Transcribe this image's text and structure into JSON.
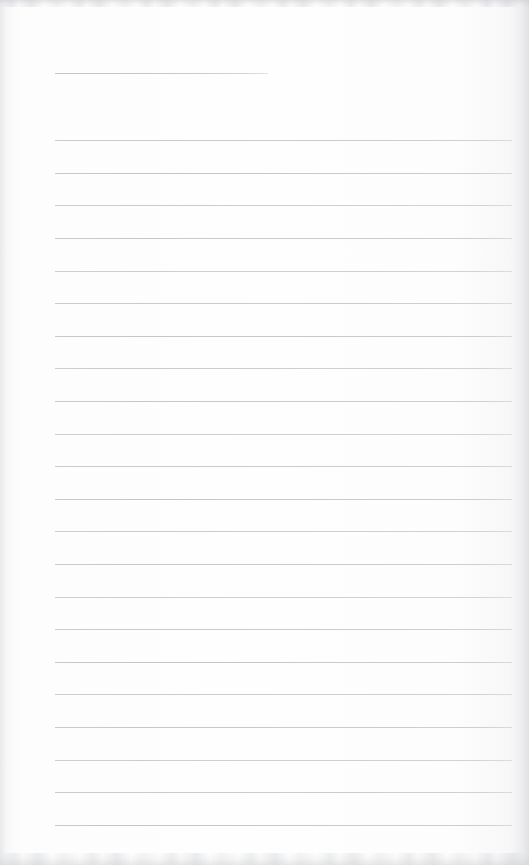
{
  "page": {
    "name": "ruled-notepad-page",
    "width": 529,
    "height": 865,
    "background_color": "#fdfdfd",
    "rule_color": "#c5c7cb",
    "edge_shadow_color": "#c8cace",
    "text_content": "",
    "is_blank": true
  },
  "header_rule": {
    "label": "title-rule",
    "x_start": 55,
    "x_end": 268,
    "y": 73,
    "width": 213,
    "thickness": 1
  },
  "ruling": {
    "label": "body-rules",
    "count": 22,
    "x_start": 55,
    "x_end": 512,
    "width": 457,
    "first_y": 140,
    "last_y": 825,
    "spacing": 32.63,
    "thickness": 1,
    "lines": [
      {
        "index": 1,
        "y": 140
      },
      {
        "index": 2,
        "y": 173
      },
      {
        "index": 3,
        "y": 205
      },
      {
        "index": 4,
        "y": 238
      },
      {
        "index": 5,
        "y": 271
      },
      {
        "index": 6,
        "y": 303
      },
      {
        "index": 7,
        "y": 336
      },
      {
        "index": 8,
        "y": 368
      },
      {
        "index": 9,
        "y": 401
      },
      {
        "index": 10,
        "y": 434
      },
      {
        "index": 11,
        "y": 466
      },
      {
        "index": 12,
        "y": 499
      },
      {
        "index": 13,
        "y": 531
      },
      {
        "index": 14,
        "y": 564
      },
      {
        "index": 15,
        "y": 597
      },
      {
        "index": 16,
        "y": 629
      },
      {
        "index": 17,
        "y": 662
      },
      {
        "index": 18,
        "y": 694
      },
      {
        "index": 19,
        "y": 727
      },
      {
        "index": 20,
        "y": 760
      },
      {
        "index": 21,
        "y": 792
      },
      {
        "index": 22,
        "y": 825
      }
    ]
  },
  "margins": {
    "label": "page-margins",
    "left": 55,
    "right": 17,
    "top": 73,
    "bottom": 40
  }
}
